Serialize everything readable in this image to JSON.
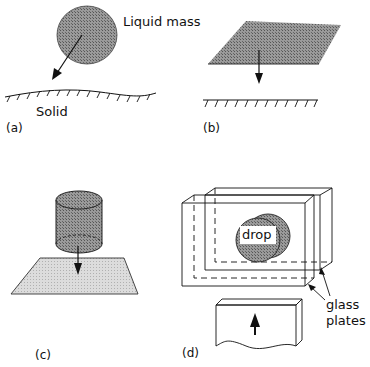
{
  "figure": {
    "panels": [
      {
        "id": "a",
        "label": "(a)",
        "texts": {
          "mass": "Liquid mass",
          "surface": "Solid"
        }
      },
      {
        "id": "b",
        "label": "(b)"
      },
      {
        "id": "c",
        "label": "(c)"
      },
      {
        "id": "d",
        "label": "(d)",
        "texts": {
          "drop": "drop",
          "plates_line1": "glass",
          "plates_line2": "plates"
        }
      }
    ]
  },
  "colors": {
    "ink": "#111111",
    "shade": "#8a8a8a",
    "light_shade": "#d4d4d4",
    "background": "#ffffff"
  }
}
